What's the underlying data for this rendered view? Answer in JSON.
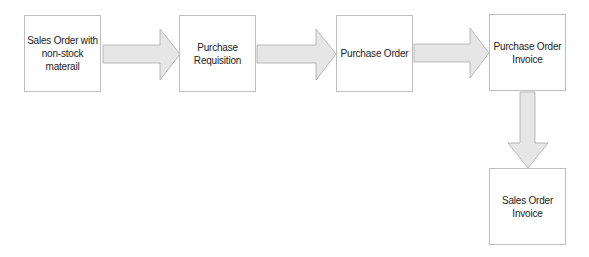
{
  "diagram": {
    "type": "flowchart",
    "nodes": [
      {
        "id": "n1",
        "label": "Sales Order with\nnon-stock materail"
      },
      {
        "id": "n2",
        "label": "Purchase\nRequisition"
      },
      {
        "id": "n3",
        "label": "Purchase Order"
      },
      {
        "id": "n4",
        "label": "Purchase Order\nInvoice"
      },
      {
        "id": "n5",
        "label": "Sales Order\nInvoice"
      }
    ],
    "edges": [
      {
        "from": "n1",
        "to": "n2",
        "direction": "right"
      },
      {
        "from": "n2",
        "to": "n3",
        "direction": "right"
      },
      {
        "from": "n3",
        "to": "n4",
        "direction": "right"
      },
      {
        "from": "n4",
        "to": "n5",
        "direction": "down"
      }
    ],
    "colors": {
      "box_border": "#bdbdbd",
      "arrow_fill": "#e6e6e6",
      "arrow_stroke": "#a9a9a9",
      "text": "#222222"
    }
  }
}
